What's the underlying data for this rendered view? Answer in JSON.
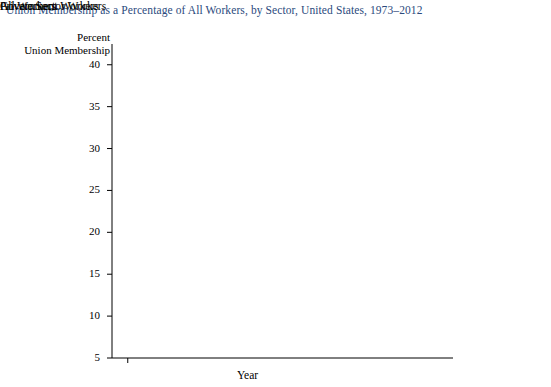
{
  "title": "Union Membership as a Percentage of All Workers, by Sector, United States, 1973–2012",
  "axis": {
    "ylabel_line1": "Percent",
    "ylabel_line2": "Union Membership",
    "xlabel": "Year",
    "yticks": [
      "40",
      "35",
      "30",
      "25",
      "20",
      "15",
      "10",
      "5"
    ],
    "xticks": [
      "1973",
      "1978",
      "1983",
      "1988",
      "1993",
      "1998",
      "2003",
      "2008",
      "2012"
    ]
  },
  "series_labels": {
    "government": "Government Workers",
    "all": "All Workers",
    "private": "Private Sector Workers"
  },
  "colors": {
    "title": "#2b4a7d",
    "government": "#7fb2dd",
    "all": "#1f6f96",
    "private": "#8a8a8a",
    "marker": "#1a1a1a",
    "axis": "#000000"
  },
  "chart_data": {
    "type": "line",
    "title": "Union Membership as a Percentage of All Workers, by Sector, United States, 1973–2012",
    "xlabel": "Year",
    "ylabel": "Percent Union Membership",
    "x": [
      1973,
      1978,
      1983,
      1988,
      1993,
      1998,
      2003,
      2008,
      2012
    ],
    "xlim": [
      1971,
      2013
    ],
    "ylim": [
      5,
      42
    ],
    "yticks": [
      5,
      10,
      15,
      20,
      25,
      30,
      35,
      40
    ],
    "grid": false,
    "legend": "right-inline-labels",
    "series": [
      {
        "name": "Government Workers",
        "color": "#7fb2dd",
        "values": [
          23.0,
          33.2,
          36.7,
          36.6,
          37.7,
          37.5,
          37.2,
          36.8,
          35.9
        ]
      },
      {
        "name": "All Workers",
        "color": "#1f6f96",
        "values": [
          24.2,
          23.0,
          20.1,
          16.8,
          15.8,
          13.9,
          12.9,
          12.4,
          11.2
        ]
      },
      {
        "name": "Private Sector Workers",
        "color": "#8a8a8a",
        "values": [
          24.2,
          20.6,
          16.5,
          12.9,
          11.1,
          9.5,
          8.2,
          7.6,
          6.6
        ]
      }
    ]
  }
}
